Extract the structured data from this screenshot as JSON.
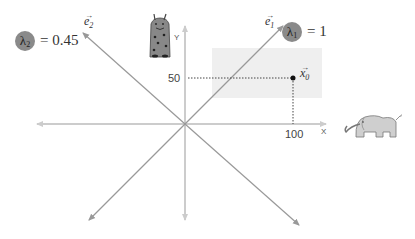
{
  "diagram": {
    "type": "eigenvector-transform-illustration",
    "colors": {
      "axis": "#cccccc",
      "eigen_line": "#999999",
      "shaded_region": "#eeeeee",
      "lambda_badge": "#8a8a8a",
      "dotted": "#444444",
      "point": "#111111"
    },
    "origin": {
      "x": 185,
      "y": 124
    },
    "axes": {
      "x_label": "X",
      "y_label": "Y",
      "x_tick": "100",
      "y_tick": "50"
    },
    "eigenvectors": [
      {
        "name": "e1",
        "label": "e",
        "sub": "1",
        "lambda_symbol": "λ",
        "lambda_sub": "1",
        "equation": "= 1"
      },
      {
        "name": "e2",
        "label": "e",
        "sub": "2",
        "lambda_symbol": "λ",
        "lambda_sub": "2",
        "equation": "= 0.45"
      }
    ],
    "point": {
      "label": "x",
      "sub": "0",
      "x_value": 100,
      "y_value": 50
    },
    "figures": {
      "left_figure": "giraffe-doodle",
      "right_figure": "elephant-doodle"
    }
  }
}
